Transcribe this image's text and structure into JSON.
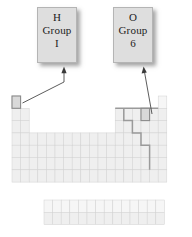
{
  "figure": {
    "kind": "periodic-table-diagram",
    "callouts": [
      {
        "id": "hydrogen",
        "symbol": "H",
        "group_label": "Group",
        "group_value": "I",
        "points_to": "period-1-group-1-cell"
      },
      {
        "id": "oxygen",
        "symbol": "O",
        "group_label": "Group",
        "group_value": "6",
        "points_to": "period-2-group-16-cell"
      }
    ],
    "highlighted_cells": [
      {
        "name": "hydrogen-cell",
        "period": 1,
        "group": 1
      },
      {
        "name": "oxygen-cell",
        "period": 2,
        "group": 16
      }
    ],
    "colors": {
      "cell_fill": "#efefef",
      "cell_border": "#d2d2d2",
      "highlight_fill": "#d9d9d9",
      "highlight_border": "#8a8a8a",
      "staircase": "#9a9a9a",
      "callout_fill": "#dedede",
      "callout_border": "#b4b4b4",
      "arrow": "#4a4a4a",
      "background": "#ffffff"
    },
    "grid": {
      "cell_w": 8.6,
      "cell_h": 12.3,
      "origin_x": 12,
      "origin_y": 96,
      "periods": 7,
      "groups": 18,
      "fblock": {
        "origin_x": 44,
        "origin_y": 200,
        "rows": 2,
        "cols": 14
      },
      "occupancy": [
        [
          1,
          0,
          0,
          0,
          0,
          0,
          0,
          0,
          0,
          0,
          0,
          0,
          0,
          0,
          0,
          0,
          0,
          1
        ],
        [
          1,
          1,
          0,
          0,
          0,
          0,
          0,
          0,
          0,
          0,
          0,
          0,
          1,
          1,
          1,
          1,
          1,
          1
        ],
        [
          1,
          1,
          0,
          0,
          0,
          0,
          0,
          0,
          0,
          0,
          0,
          0,
          1,
          1,
          1,
          1,
          1,
          1
        ],
        [
          1,
          1,
          1,
          1,
          1,
          1,
          1,
          1,
          1,
          1,
          1,
          1,
          1,
          1,
          1,
          1,
          1,
          1
        ],
        [
          1,
          1,
          1,
          1,
          1,
          1,
          1,
          1,
          1,
          1,
          1,
          1,
          1,
          1,
          1,
          1,
          1,
          1
        ],
        [
          1,
          1,
          1,
          1,
          1,
          1,
          1,
          1,
          1,
          1,
          1,
          1,
          1,
          1,
          1,
          1,
          1,
          1
        ],
        [
          1,
          1,
          1,
          1,
          1,
          1,
          1,
          1,
          1,
          1,
          1,
          1,
          1,
          1,
          1,
          1,
          1,
          1
        ]
      ],
      "staircase_path": "metalloid-dividing-line"
    }
  }
}
